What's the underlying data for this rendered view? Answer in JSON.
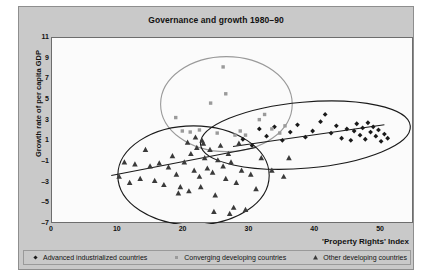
{
  "figure": {
    "title": "Governance and growth 1980–90",
    "xlabel": "'Property Rights' Index",
    "ylabel": "Growth rate of per capita GDP"
  },
  "legend": [
    {
      "key": "advanced",
      "label": "Advanced industrialized countries",
      "marker": "diamond-marker",
      "color": "#1a1a1a"
    },
    {
      "key": "converging",
      "label": "Converging developing countries",
      "marker": "square-marker",
      "color": "#9a9a9a"
    },
    {
      "key": "other",
      "label": "Other developing countries",
      "marker": "triangle-marker",
      "color": "#3a3a3a"
    }
  ],
  "chart_data": {
    "type": "scatter",
    "title": "Governance and growth 1980–90",
    "xlabel": "'Property Rights' Index",
    "ylabel": "Growth rate of per capita GDP",
    "xlim": [
      0,
      55
    ],
    "ylim": [
      -7,
      11
    ],
    "xticks": [
      0,
      10,
      20,
      30,
      40,
      50
    ],
    "yticks": [
      -7,
      -5,
      -3,
      -1,
      1,
      3,
      5,
      7,
      9,
      11
    ],
    "grid": false,
    "legend_position": "below-axes",
    "series": [
      {
        "name": "Advanced industrialized countries",
        "marker": "diamond",
        "color": "#1a1a1a",
        "points": [
          [
            29.0,
            1.2
          ],
          [
            30.4,
            0.6
          ],
          [
            31.5,
            2.2
          ],
          [
            32.6,
            1.5
          ],
          [
            33.8,
            2.4
          ],
          [
            35.0,
            1.1
          ],
          [
            36.2,
            1.9
          ],
          [
            37.3,
            2.6
          ],
          [
            38.5,
            1.4
          ],
          [
            39.6,
            2.0
          ],
          [
            40.8,
            2.9
          ],
          [
            41.5,
            3.6
          ],
          [
            42.4,
            1.8
          ],
          [
            43.2,
            2.5
          ],
          [
            44.0,
            1.3
          ],
          [
            44.8,
            2.2
          ],
          [
            45.4,
            1.1
          ],
          [
            45.9,
            2.0
          ],
          [
            46.3,
            2.7
          ],
          [
            46.8,
            1.6
          ],
          [
            47.2,
            2.3
          ],
          [
            47.6,
            1.2
          ],
          [
            48.0,
            2.8
          ],
          [
            48.4,
            1.9
          ],
          [
            48.8,
            2.4
          ],
          [
            49.2,
            1.5
          ],
          [
            49.6,
            2.1
          ],
          [
            50.0,
            1.0
          ],
          [
            50.5,
            1.7
          ],
          [
            51.0,
            1.3
          ]
        ]
      },
      {
        "name": "Converging developing countries",
        "marker": "square",
        "color": "#9a9a9a",
        "points": [
          [
            18.8,
            3.3
          ],
          [
            19.8,
            2.0
          ],
          [
            21.0,
            1.9
          ],
          [
            22.4,
            2.1
          ],
          [
            24.1,
            4.7
          ],
          [
            25.1,
            1.8
          ],
          [
            26.0,
            8.2
          ],
          [
            26.4,
            5.6
          ],
          [
            27.8,
            1.6
          ],
          [
            28.6,
            2.0
          ],
          [
            29.4,
            1.6
          ],
          [
            31.5,
            3.1
          ],
          [
            32.3,
            3.6
          ],
          [
            33.4,
            2.2
          ],
          [
            34.6,
            1.8
          ],
          [
            35.4,
            2.5
          ]
        ]
      },
      {
        "name": "Other developing countries",
        "marker": "triangle",
        "color": "#3a3a3a",
        "points": [
          [
            10.2,
            -2.4
          ],
          [
            11.0,
            -1.0
          ],
          [
            11.8,
            -3.0
          ],
          [
            12.6,
            -1.2
          ],
          [
            13.4,
            -2.6
          ],
          [
            14.2,
            0.2
          ],
          [
            14.9,
            -1.4
          ],
          [
            15.6,
            -2.8
          ],
          [
            16.3,
            -1.1
          ],
          [
            17.0,
            -3.2
          ],
          [
            17.7,
            -1.5
          ],
          [
            18.3,
            -0.4
          ],
          [
            18.9,
            -2.2
          ],
          [
            19.5,
            -3.4
          ],
          [
            20.1,
            -1.0
          ],
          [
            20.6,
            0.9
          ],
          [
            21.1,
            -0.2
          ],
          [
            21.6,
            -1.8
          ],
          [
            22.0,
            0.4
          ],
          [
            22.4,
            -2.4
          ],
          [
            22.8,
            1.1
          ],
          [
            23.2,
            -0.6
          ],
          [
            23.6,
            -1.6
          ],
          [
            24.0,
            0.2
          ],
          [
            24.4,
            -2.0
          ],
          [
            24.8,
            -4.2
          ],
          [
            25.2,
            -0.8
          ],
          [
            25.6,
            0.6
          ],
          [
            26.0,
            -1.4
          ],
          [
            26.4,
            -2.6
          ],
          [
            26.8,
            -0.2
          ],
          [
            27.2,
            -1.0
          ],
          [
            27.6,
            -5.4
          ],
          [
            28.0,
            -3.0
          ],
          [
            28.4,
            0.8
          ],
          [
            28.8,
            -1.8
          ],
          [
            29.4,
            -5.6
          ],
          [
            30.2,
            -2.2
          ],
          [
            31.0,
            -3.6
          ],
          [
            31.8,
            -0.6
          ],
          [
            23.0,
            0.8
          ],
          [
            21.8,
            1.4
          ],
          [
            33.4,
            -1.8
          ],
          [
            35.2,
            -2.4
          ],
          [
            36.0,
            -0.6
          ],
          [
            24.6,
            -5.8
          ],
          [
            27.0,
            -6.0
          ],
          [
            19.2,
            -4.0
          ],
          [
            20.8,
            -3.8
          ],
          [
            22.6,
            -3.4
          ]
        ]
      }
    ],
    "trend_lines": [
      {
        "name": "advanced-trend",
        "from": [
          27.5,
          0.5
        ],
        "to": [
          50.5,
          2.6
        ],
        "color": "#1a1a1a"
      },
      {
        "name": "other-trend",
        "from": [
          9.0,
          -2.3
        ],
        "to": [
          31.0,
          0.4
        ],
        "color": "#1a1a1a"
      }
    ],
    "ellipses": [
      {
        "name": "converging-ellipse",
        "cx": 26.5,
        "cy": 4.6,
        "rx": 10.0,
        "ry": 4.6,
        "rotate": 0,
        "color": "#9a9a9a"
      },
      {
        "name": "other-ellipse",
        "cx": 21.5,
        "cy": -2.3,
        "rx": 11.5,
        "ry": 4.8,
        "rotate": 0,
        "color": "#1a1a1a"
      },
      {
        "name": "advanced-ellipse",
        "cx": 38.5,
        "cy": 1.6,
        "rx": 16.0,
        "ry": 3.2,
        "rotate": -5,
        "color": "#1a1a1a"
      }
    ]
  }
}
